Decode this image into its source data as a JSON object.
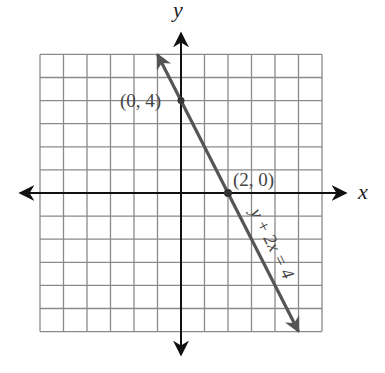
{
  "chart_data": {
    "type": "line",
    "title": "",
    "xlabel": "x",
    "ylabel": "y",
    "xlim": [
      -6,
      6
    ],
    "ylim": [
      -6,
      6
    ],
    "grid": true,
    "grid_step": 1,
    "series": [
      {
        "name": "y + 2x = 4",
        "equation": "y + 2x = 4",
        "slope": -2,
        "intercept": 4,
        "x": [
          -1,
          0,
          2,
          5
        ],
        "y": [
          6,
          4,
          0,
          -6
        ],
        "arrows_both_ends": true
      }
    ],
    "labeled_points": [
      {
        "label": "(0, 4)",
        "x": 0,
        "y": 4
      },
      {
        "label": "(2, 0)",
        "x": 2,
        "y": 0
      }
    ],
    "annotations": [
      "y + 2x = 4"
    ]
  },
  "labels": {
    "x_axis": "x",
    "y_axis": "y",
    "point_a": "(0, 4)",
    "point_b": "(2, 0)",
    "equation": "y + 2x = 4"
  },
  "colors": {
    "grid": "#8a8a8a",
    "axis": "#111111",
    "line": "#555555",
    "point": "#333333"
  }
}
